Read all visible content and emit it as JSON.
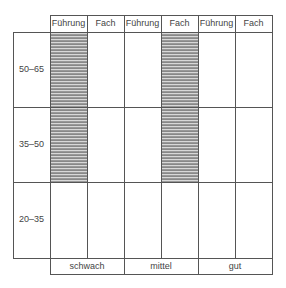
{
  "diagram": {
    "column_headers": [
      "Führung",
      "Fach",
      "Führung",
      "Fach",
      "Führung",
      "Fach"
    ],
    "row_labels": [
      "50–65",
      "35–50",
      "20–35"
    ],
    "bottom_labels": [
      "schwach",
      "mittel",
      "gut"
    ],
    "hatched_cells": [
      {
        "column": 0,
        "rows": [
          0,
          1
        ]
      },
      {
        "column": 3,
        "rows": [
          0,
          1
        ]
      }
    ],
    "colors": {
      "line": "#555555",
      "hatch_dark": "#888888",
      "hatch_light": "#d8d8d8"
    }
  }
}
